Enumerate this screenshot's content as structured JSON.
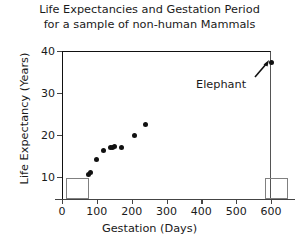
{
  "chart_data": {
    "type": "scatter",
    "title": "Life Expectancies and Gestation Period for a sample of non-human Mammals",
    "title_line1": "Life Expectancies and Gestation Period",
    "title_line2": "for a sample of non-human Mammals",
    "xlabel": "Gestation (Days)",
    "ylabel": "Life Expectancy (Years)",
    "xlim": [
      0,
      640
    ],
    "ylim": [
      0,
      41
    ],
    "xticks": [
      "0",
      "100",
      "200",
      "300",
      "400",
      "500",
      "600"
    ],
    "xtick_values": [
      0,
      100,
      200,
      300,
      400,
      500,
      600
    ],
    "yticks": [
      "10",
      "20",
      "30",
      "40"
    ],
    "ytick_values": [
      10,
      20,
      30,
      40
    ],
    "y_origin_label": "0",
    "grid": false,
    "legend": "none",
    "marker_color": "#111111",
    "box_color": "#808080",
    "points": [
      {
        "x": 75,
        "y": 6.5
      },
      {
        "x": 82,
        "y": 7.0
      },
      {
        "x": 98,
        "y": 10.5
      },
      {
        "x": 120,
        "y": 13.0
      },
      {
        "x": 138,
        "y": 13.8
      },
      {
        "x": 146,
        "y": 14.0
      },
      {
        "x": 152,
        "y": 14.2
      },
      {
        "x": 172,
        "y": 14.0
      },
      {
        "x": 207,
        "y": 17.0
      },
      {
        "x": 241,
        "y": 20.0
      },
      {
        "x": 600,
        "y": 37.0
      }
    ],
    "annotations": [
      {
        "name": "elephant-label",
        "text": "Elephant",
        "x": 600,
        "y": 37.0
      },
      {
        "name": "lower-left-box",
        "text": "",
        "x_range": [
          10,
          75
        ],
        "y_range": [
          0,
          5.5
        ]
      },
      {
        "name": "lower-right-box",
        "text": "",
        "x_range": [
          580,
          645
        ],
        "y_range": [
          0,
          5.5
        ]
      }
    ]
  }
}
